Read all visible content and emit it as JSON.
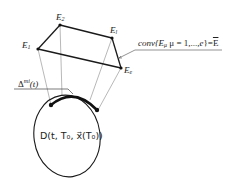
{
  "diagram": {
    "vertices": [
      {
        "id": "E1",
        "label": "E",
        "sub": "1",
        "x": 38,
        "y": 49
      },
      {
        "id": "E2",
        "label": "E",
        "sub": "2",
        "x": 60,
        "y": 25
      },
      {
        "id": "El",
        "label": "E",
        "sub": "l",
        "x": 112,
        "y": 38
      },
      {
        "id": "Ee",
        "label": "E",
        "sub": "e",
        "x": 121,
        "y": 68
      }
    ],
    "conv_label": {
      "prefix": "conv{",
      "var": "E",
      "var_sub": "μ",
      "rest": " μ = 1,...,",
      "e": "e",
      "suffix": "}=",
      "result": "E"
    },
    "delta_label": {
      "symbol": "Δ",
      "sup": "mi",
      "arg": "(t)"
    },
    "region_label": "D(t, T₀, x⃗(T₀))",
    "colors": {
      "stroke": "#111111",
      "thin": "#888888",
      "text": "#222222"
    }
  }
}
